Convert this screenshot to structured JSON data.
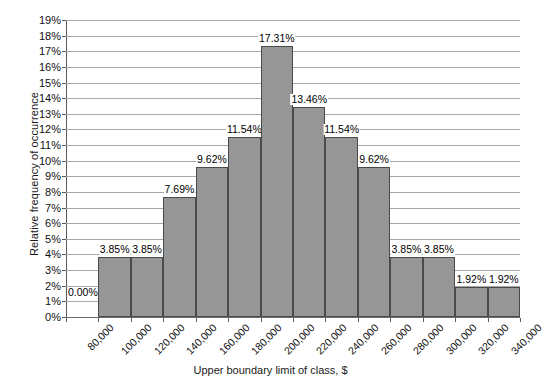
{
  "chart_data": {
    "type": "bar",
    "title": "",
    "subtitle": "",
    "xlabel": "Upper boundary limit of class, $",
    "ylabel": "Relative frequency of occurrence",
    "categories": [
      "80,000",
      "100,000",
      "120,000",
      "140,000",
      "160,000",
      "180,000",
      "200,000",
      "220,000",
      "240,000",
      "260,000",
      "280,000",
      "300,000",
      "320,000",
      "340,000"
    ],
    "values": [
      0.0,
      3.85,
      3.85,
      7.69,
      9.62,
      11.54,
      17.31,
      13.46,
      11.54,
      9.62,
      3.85,
      3.85,
      1.92,
      1.92
    ],
    "value_labels": [
      "0.00%",
      "3.85%",
      "3.85%",
      "7.69%",
      "9.62%",
      "11.54%",
      "17.31%",
      "13.46%",
      "11.54%",
      "9.62%",
      "3.85%",
      "3.85%",
      "1.92%",
      "1.92%"
    ],
    "ylim": [
      0,
      19
    ],
    "ytick_step": 1,
    "ytick_labels": [
      "19%",
      "18%",
      "17%",
      "16%",
      "15%",
      "14%",
      "13%",
      "12%",
      "11%",
      "10%",
      "9%",
      "8%",
      "7%",
      "6%",
      "5%",
      "4%",
      "3%",
      "2%",
      "1%",
      "0%"
    ],
    "grid": true,
    "legend": "none",
    "bar_color": "#969696",
    "bar_border_color": "#4a4a4a",
    "gridline_color": "#a8a8a8",
    "axis_color": "#5a5a5a",
    "note": "First class (80,000) has zero relative frequency and is drawn as an empty slot labelled 0.00%."
  },
  "axes": {
    "y_title": "Relative frequency of occurrence",
    "x_title": "Upper boundary limit of class, $"
  }
}
